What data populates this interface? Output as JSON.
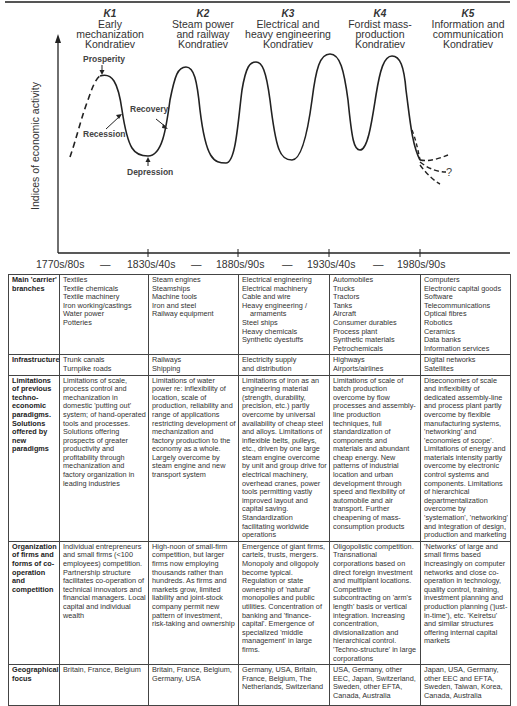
{
  "chart": {
    "ylabel": "Indices of economic activity",
    "waves": [
      {
        "id": "K1",
        "title_lines": [
          "Early",
          "mechanization",
          "Kondratiev"
        ]
      },
      {
        "id": "K2",
        "title_lines": [
          "Steam power",
          "and railway",
          "Kondratiev"
        ]
      },
      {
        "id": "K3",
        "title_lines": [
          "Electrical and",
          "heavy engineering",
          "Kondratiev"
        ]
      },
      {
        "id": "K4",
        "title_lines": [
          "Fordist mass-",
          "production",
          "Kondratiev"
        ]
      },
      {
        "id": "K5",
        "title_lines": [
          "Information and",
          "communication",
          "Kondratiev"
        ]
      }
    ],
    "phases": {
      "prosperity": "Prosperity",
      "recession": "Recession",
      "depression": "Depression",
      "recovery": "Recovery",
      "unknown": "?"
    },
    "dates": [
      "1770s/80s",
      "—",
      "1830s/40s",
      "—",
      "1880s/90s",
      "—",
      "1930s/40s",
      "—",
      "1980s/90s"
    ],
    "colors": {
      "line": "#222222",
      "text": "#333333",
      "border": "#444444"
    }
  },
  "table": {
    "rows": [
      {
        "header": "Main 'carrier' branches",
        "cells": [
          [
            "Textiles",
            "Textile chemicals",
            "Textile machinery",
            "Iron working/castings",
            "Water power",
            "Potteries"
          ],
          [
            "Steam engines",
            "Steamships",
            "Machine tools",
            "Iron and steel",
            "Railway equipment"
          ],
          [
            "Electrical engineering",
            "Electrical machinery",
            "Cable and wire",
            "Heavy engineering /",
            "armaments",
            "Steel ships",
            "Heavy chemicals",
            "Synthetic dyestuffs"
          ],
          [
            "Automobiles",
            "Trucks",
            "Tractors",
            "Tanks",
            "Aircraft",
            "Consumer durables",
            "Process plant",
            "Synthetic materials",
            "Petrochemicals"
          ],
          [
            "Computers",
            "Electronic capital goods",
            "Software",
            "Telecommunications",
            "Optical fibres",
            "Robotics",
            "Ceramics",
            "Data banks",
            "Information services"
          ]
        ]
      },
      {
        "header": "Infrastructure",
        "cells": [
          [
            "Trunk canals",
            "Turnpike roads"
          ],
          [
            "Railways",
            "Shipping"
          ],
          [
            "Electricity supply",
            "and distribution"
          ],
          [
            "Highways",
            "Airports/airlines"
          ],
          [
            "Digital networks",
            "Satellites"
          ]
        ]
      },
      {
        "header": "Limitations of previous techno-economic paradigms. Solutions offered by new paradigms",
        "cells": [
          "Limitations of scale, process control and mechanization in domestic 'putting out' system; of hand-operated tools and processes. Solutions offering prospects of greater productivity and profitability through mechanization and factory organization in leading industries",
          "Limitations of water power re: inflexibility of location, scale of production, reliability and range of applications restricting development of mechanization and factory production to the economy as a whole. Largely overcome by steam engine and new transport system",
          "Limitations of iron as an engineering material (strength, durability, precision, etc.) partly overcome by universal availability of cheap steel and alloys. Limitations of inflexible belts, pulleys, etc., driven by one large steam engine overcome by unit and group drive for electrical machinery, overhead cranes, power tools permitting vastly improved layout and capital saving. Standardization facilitating worldwide operations",
          "Limitations of scale of batch production overcome by flow processes and assembly-line production techniques, full standardization of components and materials and abundant cheap energy. New patterns of industrial location and urban development through speed and flexibility of automobile and air transport. Further cheapening of mass-consumption products",
          "Diseconomies of scale and inflexibility of dedicated assembly-line and process plant partly overcome by flexible manufacturing systems, 'networking' and 'economies of scope'. Limitations of energy and materials intensity partly overcome by electronic control systems and components. Limitations of hierarchical departmentalization overcome by 'systemation', 'networking' and integration of design, production and marketing"
        ]
      },
      {
        "header": "Organization of firms and forms of co-operation and competition",
        "cells": [
          "Individual entrepreneurs and small firms (<100 employees) competition. Partnership structure facilitates co-operation of technical innovators and financial managers. Local capital and individual wealth",
          "High-noon of small-firm competition, but larger firms now employing thousands rather than hundreds. As firms and markets grow, limited liability and joint-stock company permit new pattern of investment, risk-taking and ownership",
          "Emergence of giant firms, cartels, trusts, mergers. Monopoly and oligopoly become typical. Regulation or state ownership of 'natural' monopolies and public utilities. Concentration of banking and 'finance-capital'. Emergence of specialized 'middle management' in large firms.",
          "Oligopolistic competition. Transnational corporations based on direct foreign investment and multiplant locations. Competitive subcontracting on 'arm's length' basis or vertical integration. Increasing concentration, divisionalization and hierarchical control. 'Techno-structure' in large corporations",
          "'Networks' of large and small firms based increasingly on computer networks and close co-operation in technology, quality control, training, investment planning and production planning ('just-in-time'), etc. 'Keiretsu' and similar structures offering internal capital markets"
        ]
      },
      {
        "header": "Geographical focus",
        "cells": [
          "Britain, France, Belgium",
          "Britain, France, Belgium, Germany, USA",
          "Germany, USA, Britain, France, Belgium, The Netherlands, Switzerland",
          "USA, Germany, other EEC, Japan, Switzerland, Sweden, other EFTA, Canada, Australia",
          "Japan, USA, Germany, other EEC and EFTA, Sweden, Taiwan, Korea, Canada, Australia"
        ]
      }
    ]
  }
}
